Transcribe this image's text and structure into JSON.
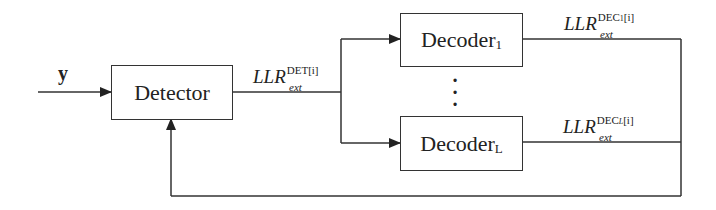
{
  "diagram": {
    "input": {
      "label": "y"
    },
    "detector": {
      "label": "Detector"
    },
    "decoders": [
      {
        "label": "Decoder",
        "subscript": "1"
      },
      {
        "label": "Decoder",
        "subscript": "L"
      }
    ],
    "ellipsis": "⋮",
    "signals": {
      "det_output": {
        "base": "LLR",
        "sub": "ext",
        "sup": "DET",
        "sup_index": "[i]"
      },
      "dec1_output": {
        "base": "LLR",
        "sub": "ext",
        "sup": "DEC",
        "sup_sub": "1",
        "sup_index": "[i]"
      },
      "decL_output": {
        "base": "LLR",
        "sub": "ext",
        "sup": "DEC",
        "sup_sub": "L",
        "sup_index": "[i]"
      }
    },
    "colors": {
      "line": "#333333",
      "background": "#ffffff"
    }
  }
}
